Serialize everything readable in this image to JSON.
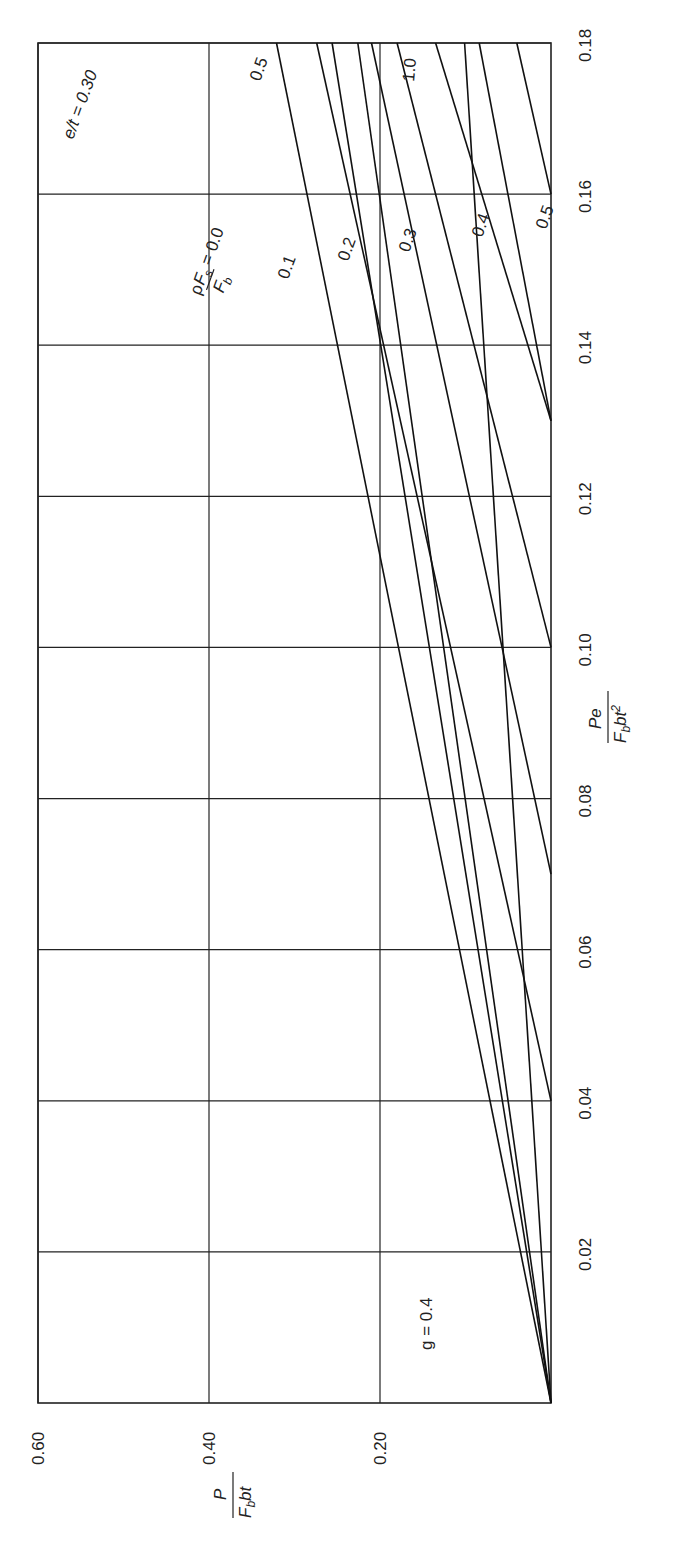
{
  "chart_data": {
    "type": "line",
    "orientation": "rotated-90",
    "title": "",
    "xlabel": "Pe / (F_b b t^2)",
    "ylabel": "P / (F_b b t)",
    "xlim": [
      0,
      0.18
    ],
    "ylim": [
      0,
      0.6
    ],
    "x_ticks": [
      "0.02",
      "0.04",
      "0.06",
      "0.08",
      "0.10",
      "0.12",
      "0.14",
      "0.16",
      "0.18"
    ],
    "y_ticks": [
      "0.20",
      "0.40",
      "0.60"
    ],
    "grid": true,
    "annotations": [
      "g = 0.4",
      "e/t = 0.30",
      "ρF_s/F_b = 0.0"
    ],
    "series": [
      {
        "name": "e/t = 0.30",
        "family": "e/t",
        "label": "e/t = 0.30",
        "points": [
          [
            0,
            0
          ],
          [
            0.18,
            0.321
          ]
        ]
      },
      {
        "name": "e/t = 0.5",
        "family": "e/t",
        "label": "0.5",
        "points": [
          [
            0,
            0
          ],
          [
            0.18,
            0.226
          ]
        ]
      },
      {
        "name": "e/t (unlabeled)",
        "family": "e/t",
        "label": "",
        "points": [
          [
            0,
            0
          ],
          [
            0.18,
            0.256
          ]
        ]
      },
      {
        "name": "e/t = 1.0",
        "family": "e/t",
        "label": "1.0",
        "points": [
          [
            0,
            0
          ],
          [
            0.18,
            0.101
          ]
        ]
      },
      {
        "name": "ρFs/Fb = 0.0",
        "family": "rho",
        "label": "0.0",
        "points": [
          [
            0.04,
            0
          ],
          [
            0.18,
            0.274
          ]
        ]
      },
      {
        "name": "ρFs/Fb = 0.1",
        "family": "rho",
        "label": "0.1",
        "points": [
          [
            0.07,
            0
          ],
          [
            0.18,
            0.21
          ]
        ]
      },
      {
        "name": "ρFs/Fb = 0.2",
        "family": "rho",
        "label": "0.2",
        "points": [
          [
            0.1,
            0
          ],
          [
            0.18,
            0.18
          ]
        ]
      },
      {
        "name": "ρFs/Fb = 0.3",
        "family": "rho",
        "label": "0.3",
        "points": [
          [
            0.13,
            0
          ],
          [
            0.18,
            0.135
          ]
        ]
      },
      {
        "name": "ρFs/Fb = 0.4",
        "family": "rho",
        "label": "0.4",
        "points": [
          [
            0.13,
            0
          ],
          [
            0.18,
            0.084
          ]
        ]
      },
      {
        "name": "ρFs/Fb = 0.5",
        "family": "rho",
        "label": "0.5",
        "points": [
          [
            0.16,
            0
          ],
          [
            0.18,
            0.04
          ]
        ]
      }
    ]
  },
  "labels": {
    "g_value": "g = 0.4",
    "et_label": "e/t = 0.30",
    "et_05": "0.5",
    "et_10": "1.0",
    "rho_prefix": "ρ",
    "rho_Fs": "F",
    "rho_s": "s",
    "rho_eq": " = 0.0",
    "rho_Fb": "F",
    "rho_b": "b",
    "rho_01": "0.1",
    "rho_02": "0.2",
    "rho_03": "0.3",
    "rho_04": "0.4",
    "rho_05": "0.5",
    "xaxis_num": "Pe",
    "xaxis_den_F": "F",
    "xaxis_den_b": "b",
    "xaxis_den_rest": "bt",
    "xaxis_den_sup": "2",
    "yaxis_num": "P",
    "yaxis_den_F": "F",
    "yaxis_den_b": "b",
    "yaxis_den_rest": "bt"
  }
}
